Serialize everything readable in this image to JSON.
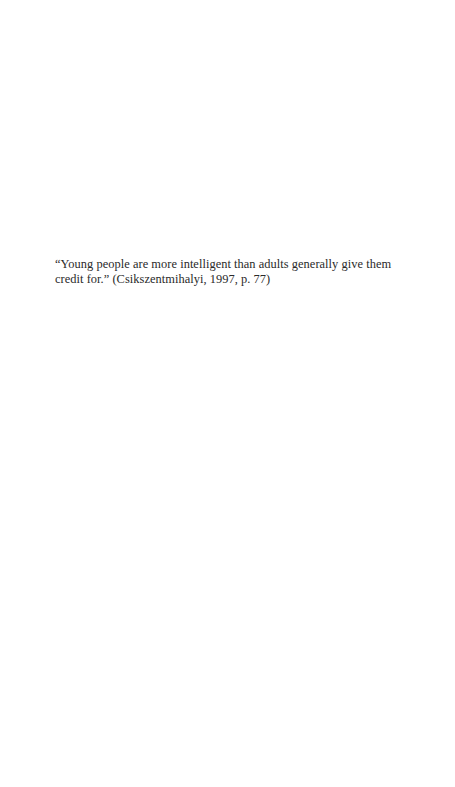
{
  "epigraph": {
    "quote_line_1": "“Young people are more intelligent than adults generally give them",
    "quote_line_2_quote": "credit for.”",
    "citation": " (Csikszentmihalyi, 1997, p. 77)"
  }
}
